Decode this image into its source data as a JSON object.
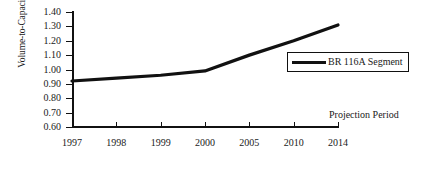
{
  "chart_data": {
    "type": "line",
    "title": "",
    "subtitle": "",
    "xlabel": "",
    "ylabel": "Volume-to-Capacity Ratio",
    "categories": [
      "1997",
      "1998",
      "1999",
      "2000",
      "2005",
      "2010",
      "2014"
    ],
    "series": [
      {
        "name": "BR 116A Segment",
        "values": [
          0.92,
          0.94,
          0.96,
          0.99,
          1.1,
          1.2,
          1.31
        ],
        "color": "#111111"
      }
    ],
    "ylim": [
      0.6,
      1.4
    ],
    "yticks": [
      "1.40",
      "1.30",
      "1.20",
      "1.10",
      "1.00",
      "0.90",
      "0.80",
      "0.70",
      "0.60"
    ],
    "ytick_values": [
      1.4,
      1.3,
      1.2,
      1.1,
      1.0,
      0.9,
      0.8,
      0.7,
      0.6
    ],
    "grid": false,
    "legend_position": "inside-right",
    "annotations": [
      {
        "text": "Projection Period",
        "x": "2014",
        "y": 0.7
      }
    ]
  },
  "legend": {
    "entries": [
      {
        "label": "BR 116A Segment"
      }
    ]
  },
  "annotation": {
    "projection_period": "Projection Period"
  },
  "axis": {
    "y_title": "Volume-to-Capacity Ratio"
  },
  "colors": {
    "line": "#111111",
    "axis": "#111111",
    "background": "#ffffff"
  }
}
